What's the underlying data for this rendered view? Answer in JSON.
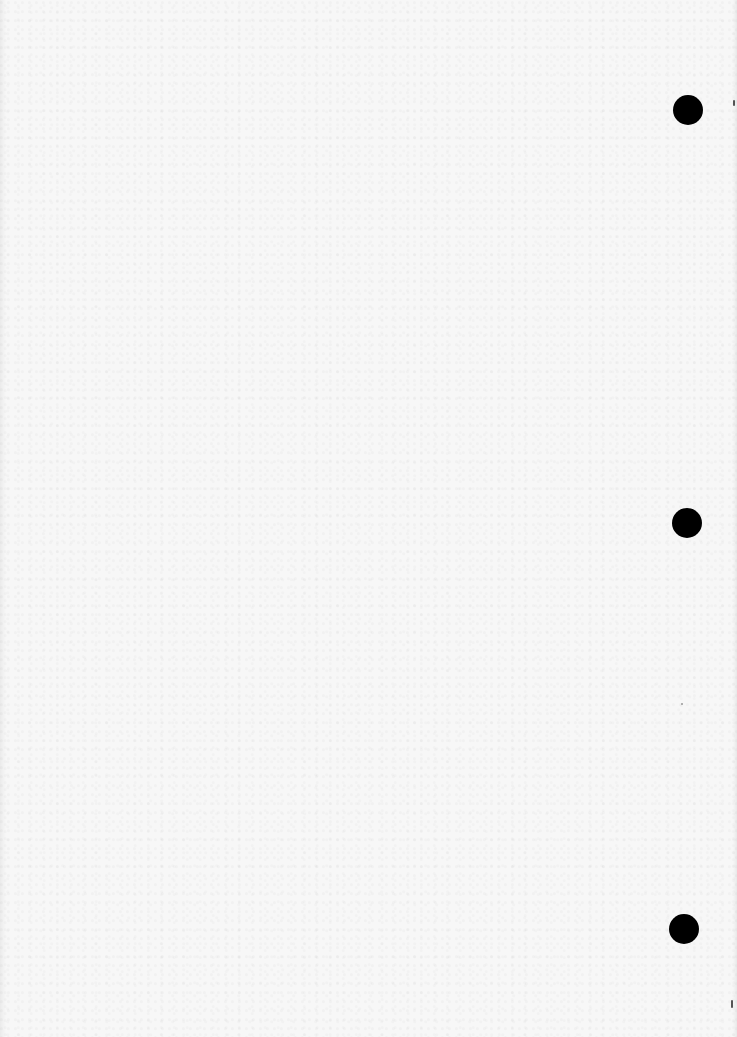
{
  "document": {
    "type": "scanned blank page",
    "background_color": "#f7f7f7",
    "text_content": "",
    "punch_holes": [
      {
        "name": "top",
        "cx": 688,
        "cy": 110,
        "r": 15,
        "color": "#000000"
      },
      {
        "name": "middle",
        "cx": 687,
        "cy": 523,
        "r": 15,
        "color": "#000000"
      },
      {
        "name": "bottom",
        "cx": 684,
        "cy": 929,
        "r": 15,
        "color": "#000000"
      }
    ],
    "edge_marks": [
      {
        "x": 733,
        "y": 100,
        "w": 2,
        "h": 6
      },
      {
        "x": 731,
        "y": 1000,
        "w": 2,
        "h": 8
      },
      {
        "x": 681,
        "y": 703,
        "w": 2,
        "h": 2
      }
    ]
  }
}
